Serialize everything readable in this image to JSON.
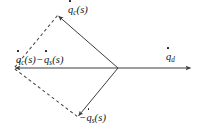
{
  "figure": {
    "name": "velocity-vector-parallelogram-diagram",
    "width": 203,
    "height": 135,
    "background_color": "#ffffff",
    "stroke_color": "#3d3d3d",
    "text_color": "#141414"
  },
  "labels": {
    "top_vector": {
      "id": "q-dot-c-of-s",
      "text": "q̇_c(s)",
      "base": "q",
      "subscript": "c",
      "argument": "(s)",
      "has_overdot": true,
      "leading_minus": false
    },
    "left_vector": {
      "id": "q-dot-c-of-s-minus-q-dot-s-of-s",
      "text": "q̇_c(s) − q̇_s(s)",
      "term_one_base": "q",
      "term_one_subscript": "c",
      "term_one_argument": "(s)",
      "operator": "−",
      "term_two_base": "q",
      "term_two_subscript": "s",
      "term_two_argument": "(s)",
      "has_overdot": true
    },
    "bottom_vector": {
      "id": "minus-q-dot-s-of-s",
      "text": "−q̇_s(s)",
      "base": "q",
      "subscript": "s",
      "argument": "(s)",
      "has_overdot": true,
      "leading_minus": true,
      "minus_sign": "−"
    },
    "right_vector": {
      "id": "q-dot-d",
      "text": "q̇_d",
      "base": "q",
      "subscript": "d",
      "argument": "",
      "has_overdot": true,
      "leading_minus": false
    }
  },
  "geometry": {
    "center_vertex": {
      "x": 118,
      "y": 68
    },
    "left_vertex": {
      "x": 14,
      "y": 68
    },
    "top_vertex": {
      "x": 58,
      "y": 15
    },
    "bottom_vertex": {
      "x": 78,
      "y": 117
    },
    "right_tip": {
      "x": 192,
      "y": 68
    }
  },
  "edges": [
    {
      "name": "solid-arrow-center-to-top",
      "style": "solid",
      "arrow": true,
      "from": "center_vertex",
      "to": "top_vertex"
    },
    {
      "name": "solid-arrow-center-to-bottom",
      "style": "solid",
      "arrow": true,
      "from": "center_vertex",
      "to": "bottom_vertex"
    },
    {
      "name": "solid-arrow-center-to-left",
      "style": "solid",
      "arrow": true,
      "from": "center_vertex",
      "to": "left_vertex"
    },
    {
      "name": "solid-arrow-center-to-right",
      "style": "solid",
      "arrow": true,
      "from": "center_vertex",
      "to": "right_tip"
    },
    {
      "name": "dashed-left-to-top",
      "style": "dashed",
      "arrow": false,
      "from": "left_vertex",
      "to": "top_vertex"
    },
    {
      "name": "dashed-left-to-bottom",
      "style": "dashed",
      "arrow": false,
      "from": "left_vertex",
      "to": "bottom_vertex"
    }
  ]
}
